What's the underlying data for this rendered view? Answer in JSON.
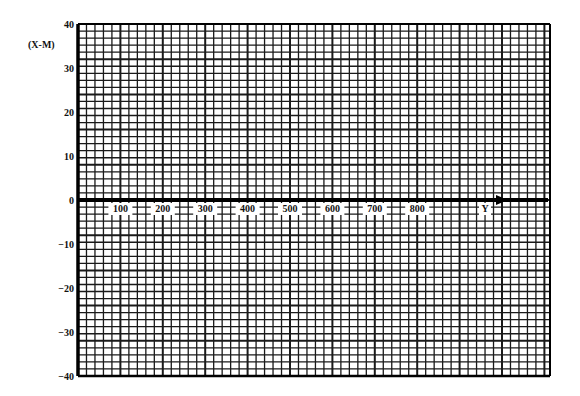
{
  "chart_data": {
    "type": "line",
    "title": "",
    "xlabel": "Y",
    "ylabel": "(X-M)",
    "x_ticks": [
      100,
      200,
      300,
      400,
      500,
      600,
      700,
      800
    ],
    "x_tick_labels": [
      "100",
      "200",
      "300",
      "400",
      "500",
      "600",
      "700",
      "800"
    ],
    "y_ticks": [
      40,
      30,
      20,
      10,
      0,
      -10,
      -20,
      -30,
      -40
    ],
    "y_tick_labels": [
      "40",
      "30",
      "20",
      "10",
      "0",
      "-10",
      "-20",
      "-30",
      "-40"
    ],
    "xlim": [
      0,
      1100
    ],
    "ylim": [
      -40,
      40
    ],
    "grid": true,
    "grid_minor_per_major": 5,
    "series": [],
    "annotations": [
      "Y axis arrow along 0 line"
    ],
    "legend": null
  },
  "colors": {
    "grid": "#1a1a1a",
    "axis": "#000000",
    "background": "#ffffff"
  }
}
